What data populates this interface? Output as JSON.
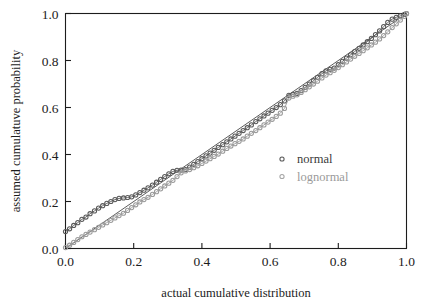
{
  "chart_data": {
    "type": "scatter",
    "title": "",
    "xlabel": "actual cumulative distribution",
    "ylabel": "assumed cumulatuve probability",
    "xlim": [
      0.0,
      1.0
    ],
    "ylim": [
      0.0,
      1.0
    ],
    "xticks": [
      "0.0",
      "0.2",
      "0.4",
      "0.6",
      "0.8",
      "1.0"
    ],
    "yticks": [
      "0.0",
      "0.2",
      "0.4",
      "0.6",
      "0.8",
      "1.0"
    ],
    "xtick_values": [
      0.0,
      0.2,
      0.4,
      0.6,
      0.8,
      1.0
    ],
    "ytick_values": [
      0.0,
      0.2,
      0.4,
      0.6,
      0.8,
      1.0
    ],
    "grid": false,
    "legend_position": "center-right",
    "reference_line": {
      "from": [
        0.0,
        0.0
      ],
      "to": [
        1.0,
        1.0
      ]
    },
    "marker": "open-circle",
    "series": [
      {
        "name": "normal",
        "color": "#595959",
        "x": [
          0.0,
          0.012,
          0.024,
          0.036,
          0.048,
          0.06,
          0.072,
          0.085,
          0.097,
          0.109,
          0.121,
          0.133,
          0.145,
          0.157,
          0.17,
          0.182,
          0.194,
          0.206,
          0.218,
          0.23,
          0.242,
          0.255,
          0.267,
          0.279,
          0.291,
          0.303,
          0.315,
          0.327,
          0.339,
          0.352,
          0.364,
          0.376,
          0.388,
          0.4,
          0.412,
          0.424,
          0.436,
          0.448,
          0.461,
          0.473,
          0.485,
          0.497,
          0.509,
          0.521,
          0.533,
          0.545,
          0.558,
          0.57,
          0.582,
          0.594,
          0.606,
          0.618,
          0.63,
          0.642,
          0.655,
          0.667,
          0.679,
          0.691,
          0.703,
          0.715,
          0.727,
          0.739,
          0.752,
          0.764,
          0.776,
          0.788,
          0.8,
          0.812,
          0.824,
          0.836,
          0.848,
          0.861,
          0.873,
          0.885,
          0.897,
          0.909,
          0.921,
          0.933,
          0.945,
          0.958,
          0.97,
          0.982,
          0.994,
          1.0
        ],
        "y": [
          0.072,
          0.084,
          0.098,
          0.11,
          0.124,
          0.134,
          0.148,
          0.16,
          0.172,
          0.182,
          0.192,
          0.2,
          0.208,
          0.213,
          0.215,
          0.217,
          0.22,
          0.228,
          0.238,
          0.248,
          0.258,
          0.27,
          0.282,
          0.294,
          0.306,
          0.318,
          0.328,
          0.333,
          0.334,
          0.336,
          0.346,
          0.358,
          0.37,
          0.382,
          0.394,
          0.406,
          0.418,
          0.43,
          0.442,
          0.454,
          0.466,
          0.478,
          0.49,
          0.502,
          0.514,
          0.526,
          0.54,
          0.552,
          0.564,
          0.576,
          0.588,
          0.6,
          0.612,
          0.628,
          0.652,
          0.656,
          0.66,
          0.672,
          0.686,
          0.7,
          0.714,
          0.728,
          0.744,
          0.756,
          0.762,
          0.768,
          0.782,
          0.796,
          0.81,
          0.824,
          0.838,
          0.852,
          0.866,
          0.88,
          0.894,
          0.91,
          0.926,
          0.944,
          0.962,
          0.976,
          0.984,
          0.99,
          0.996,
          1.0
        ]
      },
      {
        "name": "lognormal",
        "color": "#9a9a9a",
        "x": [
          0.0,
          0.012,
          0.024,
          0.036,
          0.048,
          0.06,
          0.072,
          0.085,
          0.097,
          0.109,
          0.121,
          0.133,
          0.145,
          0.157,
          0.17,
          0.182,
          0.194,
          0.206,
          0.218,
          0.23,
          0.242,
          0.255,
          0.267,
          0.279,
          0.291,
          0.303,
          0.315,
          0.327,
          0.339,
          0.352,
          0.364,
          0.376,
          0.388,
          0.4,
          0.412,
          0.424,
          0.436,
          0.448,
          0.461,
          0.473,
          0.485,
          0.497,
          0.509,
          0.521,
          0.533,
          0.545,
          0.558,
          0.57,
          0.582,
          0.594,
          0.606,
          0.618,
          0.63,
          0.642,
          0.655,
          0.667,
          0.679,
          0.691,
          0.703,
          0.715,
          0.727,
          0.739,
          0.752,
          0.764,
          0.776,
          0.788,
          0.8,
          0.812,
          0.824,
          0.836,
          0.848,
          0.861,
          0.873,
          0.885,
          0.897,
          0.909,
          0.921,
          0.933,
          0.945,
          0.958,
          0.97,
          0.982,
          0.994,
          1.0
        ],
        "y": [
          0.004,
          0.014,
          0.026,
          0.038,
          0.05,
          0.06,
          0.07,
          0.08,
          0.09,
          0.1,
          0.11,
          0.12,
          0.13,
          0.14,
          0.15,
          0.162,
          0.174,
          0.186,
          0.198,
          0.208,
          0.218,
          0.23,
          0.242,
          0.254,
          0.266,
          0.278,
          0.29,
          0.306,
          0.322,
          0.33,
          0.336,
          0.344,
          0.352,
          0.362,
          0.372,
          0.382,
          0.392,
          0.402,
          0.414,
          0.426,
          0.436,
          0.446,
          0.456,
          0.466,
          0.478,
          0.49,
          0.502,
          0.514,
          0.526,
          0.538,
          0.55,
          0.562,
          0.576,
          0.596,
          0.64,
          0.648,
          0.654,
          0.664,
          0.676,
          0.688,
          0.7,
          0.712,
          0.726,
          0.738,
          0.748,
          0.758,
          0.77,
          0.782,
          0.794,
          0.806,
          0.818,
          0.83,
          0.842,
          0.854,
          0.866,
          0.878,
          0.892,
          0.906,
          0.922,
          0.94,
          0.956,
          0.972,
          0.988,
          1.0
        ]
      }
    ]
  },
  "legend": {
    "entries": [
      {
        "label": "normal",
        "color": "#3a3a3a",
        "marker_color": "#595959"
      },
      {
        "label": "lognormal",
        "color": "#9a9a9a",
        "marker_color": "#a5a5a5"
      }
    ]
  },
  "colors": {
    "axis": "#1c1c1c",
    "background": "#ffffff",
    "normal": "#595959",
    "lognormal": "#9a9a9a"
  }
}
